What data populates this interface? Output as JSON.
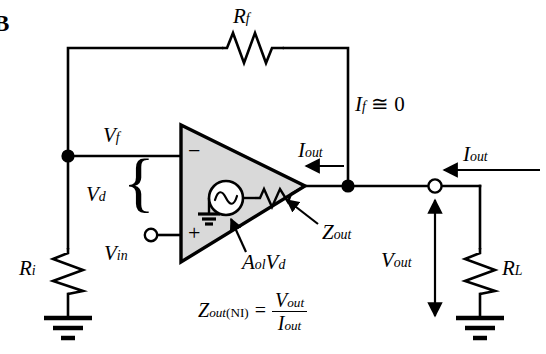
{
  "figure": {
    "panel_letter": "B",
    "background_color": "#ffffff",
    "line_color": "#000000",
    "opamp_fill_color": "#d9d9d9"
  },
  "labels": {
    "rf": {
      "base": "R",
      "sub": "f"
    },
    "ri": {
      "base": "R",
      "sub": "i"
    },
    "rl": {
      "base": "R",
      "sub": "L"
    },
    "vf": {
      "base": "V",
      "sub": "f"
    },
    "vd": {
      "base": "V",
      "sub": "d"
    },
    "vin": {
      "base": "V",
      "sub": "in"
    },
    "vout_right": {
      "base": "V",
      "sub": "out"
    },
    "if_zero": {
      "base": "I",
      "sub": "f",
      "rel": " ≅ 0"
    },
    "iout_mid": {
      "base": "I",
      "sub": "out"
    },
    "iout_right": {
      "base": "I",
      "sub": "out"
    },
    "zout": {
      "base": "Z",
      "sub": "out"
    },
    "aolvd": {
      "base_a": "A",
      "sub_a": "ol",
      "base_v": "V",
      "sub_v": "d"
    },
    "opamp_minus": "−",
    "opamp_plus": "+"
  },
  "formula": {
    "lhs_base": "Z",
    "lhs_sub": "out",
    "lhs_sub_paren": "(NI)",
    "equals": "=",
    "numerator_base": "V",
    "numerator_sub": "out",
    "denominator_base": "I",
    "denominator_sub": "out"
  },
  "components": [
    {
      "name": "feedback-resistor",
      "label": "Rf",
      "orientation": "horizontal"
    },
    {
      "name": "input-resistor",
      "label": "Ri",
      "orientation": "vertical"
    },
    {
      "name": "load-resistor",
      "label": "RL",
      "orientation": "vertical"
    },
    {
      "name": "output-impedance-resistor",
      "label": "Zout",
      "orientation": "horizontal"
    },
    {
      "name": "dependent-source",
      "label": "AolVd",
      "type": "ac-source"
    },
    {
      "name": "opamp",
      "label": "operational amplifier",
      "type": "triangle"
    }
  ],
  "nodes": [
    {
      "name": "inverting-input-junction",
      "type": "filled-dot"
    },
    {
      "name": "output-junction",
      "type": "filled-dot"
    },
    {
      "name": "vin-terminal",
      "type": "open-circle"
    },
    {
      "name": "vout-terminal",
      "type": "open-circle"
    }
  ],
  "grounds": [
    {
      "name": "ri-ground"
    },
    {
      "name": "source-ground"
    },
    {
      "name": "rl-ground"
    }
  ]
}
